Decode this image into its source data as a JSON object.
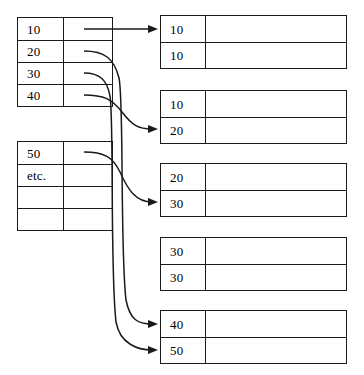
{
  "diagram": {
    "background_color": "#ffffff",
    "line_color": "#1a1a1a",
    "source_tables": [
      {
        "name": "source-table-1",
        "rows": [
          {
            "key": "10",
            "pointer": ""
          },
          {
            "key": "20",
            "pointer": ""
          },
          {
            "key": "30",
            "pointer": ""
          },
          {
            "key": "40",
            "pointer": ""
          }
        ]
      },
      {
        "name": "source-table-2",
        "rows": [
          {
            "key": "50",
            "pointer": ""
          },
          {
            "key": "etc.",
            "pointer": ""
          },
          {
            "key": "",
            "pointer": ""
          },
          {
            "key": "",
            "pointer": ""
          }
        ]
      }
    ],
    "target_tables": [
      {
        "name": "target-table-1",
        "rows": [
          {
            "key": "10",
            "value": ""
          },
          {
            "key": "10",
            "value": ""
          }
        ]
      },
      {
        "name": "target-table-2",
        "rows": [
          {
            "key": "10",
            "value": ""
          },
          {
            "key": "20",
            "value": ""
          }
        ]
      },
      {
        "name": "target-table-3",
        "rows": [
          {
            "key": "20",
            "value": ""
          },
          {
            "key": "30",
            "value": ""
          }
        ]
      },
      {
        "name": "target-table-4",
        "rows": [
          {
            "key": "30",
            "value": ""
          },
          {
            "key": "30",
            "value": ""
          }
        ]
      },
      {
        "name": "target-table-5",
        "rows": [
          {
            "key": "40",
            "value": ""
          },
          {
            "key": "50",
            "value": ""
          }
        ]
      }
    ],
    "links": [
      {
        "from": "source-table-1.row-1",
        "from_key": "10",
        "to": "target-table-1.row-1",
        "to_key": "10",
        "arrow": true
      },
      {
        "from": "source-table-1.row-2",
        "from_key": "20",
        "to": "target-table-5.row-1",
        "to_key": "40",
        "arrow": true
      },
      {
        "from": "source-table-1.row-3",
        "from_key": "30",
        "to": "target-table-5.row-2",
        "to_key": "50",
        "arrow": true
      },
      {
        "from": "source-table-1.row-4",
        "from_key": "40",
        "to": "target-table-2.row-2",
        "to_key": "20",
        "arrow": true
      },
      {
        "from": "source-table-2.row-1",
        "from_key": "50",
        "to": "target-table-3.row-2",
        "to_key": "30",
        "arrow": true
      }
    ]
  }
}
